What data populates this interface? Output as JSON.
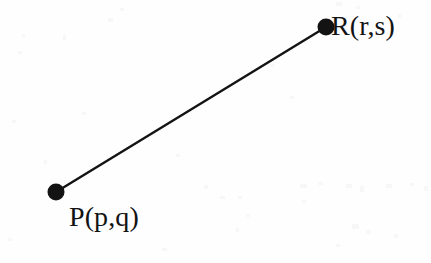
{
  "figure": {
    "width": 431,
    "height": 263,
    "background_color": "#fefefe",
    "ink_color": "#131313"
  },
  "chart_data": {
    "type": "scatter",
    "title": "",
    "subtitle": "",
    "xlabel": "",
    "ylabel": "",
    "grid": false,
    "legend": null,
    "axes_visible": false,
    "points": [
      {
        "id": "P",
        "label": "P(p,q)",
        "symbol": "filled-circle",
        "x_px": 56,
        "y_px": 192,
        "marker_diameter_px": 17,
        "color": "#131313",
        "label_position": "below-right"
      },
      {
        "id": "R",
        "label": "R(r,s)",
        "symbol": "filled-circle",
        "x_px": 326,
        "y_px": 27,
        "marker_diameter_px": 17,
        "color": "#131313",
        "label_position": "right"
      }
    ],
    "segments": [
      {
        "from": "P",
        "to": "R",
        "x1_px": 56,
        "y1_px": 192,
        "x2_px": 326,
        "y2_px": 27,
        "stroke_width_px": 2.4,
        "color": "#131313",
        "style": "solid"
      }
    ],
    "annotations": [
      {
        "text": "P(p,q)",
        "x_px": 69,
        "y_px": 228
      },
      {
        "text": "R(r,s)",
        "x_px": 331,
        "y_px": 37
      }
    ]
  },
  "labels": {
    "point_p": "P(p,q)",
    "point_r": "R(r,s)"
  },
  "marks": {
    "dot_p_name": "point-p-dot",
    "dot_r_name": "point-r-dot",
    "segment_name": "segment-pr"
  }
}
